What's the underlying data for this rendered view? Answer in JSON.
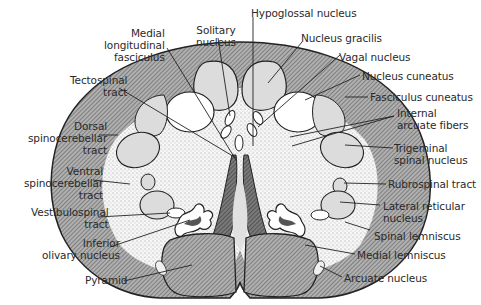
{
  "diagram": {
    "colors": {
      "background": "#ffffff",
      "outline": "#222222",
      "tract_hatch": "#8a8a8a",
      "nucleus_fill": "#dcdcdc",
      "stipple_fill": "#efefef",
      "pyramid_fill": "#8f8f8f",
      "dark_fill": "#555555"
    },
    "labels_left": [
      {
        "id": "medial-longitudinal-fasciculus",
        "lines": [
          "Medial",
          "longitudinal",
          "fasciculus"
        ]
      },
      {
        "id": "solitary-nucleus",
        "lines": [
          "Solitary",
          "nucleus"
        ]
      },
      {
        "id": "tectospinal-tract",
        "lines": [
          "Tectospinal",
          "tract"
        ]
      },
      {
        "id": "dorsal-spinocerebellar-tract",
        "lines": [
          "Dorsal",
          "spinocerebellar",
          "tract"
        ]
      },
      {
        "id": "ventral-spinocerebellar-tract",
        "lines": [
          "Ventral",
          "spinocerebellar",
          "tract"
        ]
      },
      {
        "id": "vestibulospinal-tract",
        "lines": [
          "Vestibulospinal",
          "tract"
        ]
      },
      {
        "id": "inferior-olivary-nucleus",
        "lines": [
          "Inferior",
          "olivary nucleus"
        ]
      },
      {
        "id": "pyramid",
        "lines": [
          "Pyramid"
        ]
      }
    ],
    "labels_right": [
      {
        "id": "hypoglossal-nucleus",
        "lines": [
          "Hypoglossal nucleus"
        ]
      },
      {
        "id": "nucleus-gracilis",
        "lines": [
          "Nucleus gracilis"
        ]
      },
      {
        "id": "vagal-nucleus",
        "lines": [
          "Vagal nucleus"
        ]
      },
      {
        "id": "nucleus-cuneatus",
        "lines": [
          "Nucleus cuneatus"
        ]
      },
      {
        "id": "fasciculus-cuneatus",
        "lines": [
          "Fasciculus cuneatus"
        ]
      },
      {
        "id": "internal-arcuate-fibers",
        "lines": [
          "Internal",
          "arcuate fibers"
        ]
      },
      {
        "id": "trigeminal-spinal-nucleus",
        "lines": [
          "Trigeminal",
          "spinal nucleus"
        ]
      },
      {
        "id": "rubrospinal-tract",
        "lines": [
          "Rubrospinal tract"
        ]
      },
      {
        "id": "lateral-reticular-nucleus",
        "lines": [
          "Lateral reticular",
          "nucleus"
        ]
      },
      {
        "id": "spinal-lemniscus",
        "lines": [
          "Spinal lemniscus"
        ]
      },
      {
        "id": "medial-lemniscus",
        "lines": [
          "Medial lemniscus"
        ]
      },
      {
        "id": "arcuate-nucleus",
        "lines": [
          "Arcuate nucleus"
        ]
      }
    ]
  }
}
